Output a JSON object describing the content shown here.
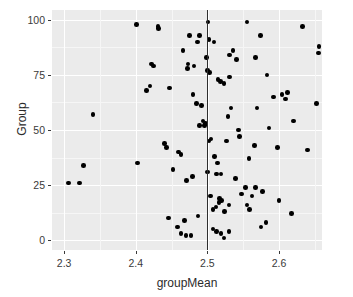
{
  "axes": {
    "x_title": "groupMean",
    "y_title": "Group",
    "x_ticks": [
      {
        "label": "2.3",
        "value": 2.3
      },
      {
        "label": "2.4",
        "value": 2.4
      },
      {
        "label": "2.5",
        "value": 2.5
      },
      {
        "label": "2.6",
        "value": 2.6
      }
    ],
    "y_ticks": [
      {
        "label": "0",
        "value": 0
      },
      {
        "label": "25",
        "value": 25
      },
      {
        "label": "50",
        "value": 50
      },
      {
        "label": "75",
        "value": 75
      },
      {
        "label": "100",
        "value": 100
      }
    ]
  },
  "style": {
    "panel_background": "#ebebeb",
    "gridline_major": "#ffffff",
    "gridline_minor": "#f6f6f6",
    "point_color": "#000000",
    "reference_line_color": "#2e2e2e",
    "text_color": "#3a3a3a"
  },
  "chart_data": {
    "type": "scatter",
    "title": "",
    "xlabel": "groupMean",
    "ylabel": "Group",
    "xlim": [
      2.283,
      2.66
    ],
    "ylim": [
      -4.5,
      104.5
    ],
    "grid": true,
    "legend": "none",
    "annotations": [
      {
        "type": "vline",
        "x": 2.5,
        "color": "#2e2e2e",
        "label": "overall mean"
      }
    ],
    "x": [
      2.401,
      2.431,
      2.432,
      2.475,
      2.489,
      2.555,
      2.633,
      2.486,
      2.501,
      2.422,
      2.425,
      2.502,
      2.509,
      2.466,
      2.472,
      2.531,
      2.536,
      2.656,
      2.655,
      2.574,
      2.499,
      2.473,
      2.541,
      2.481,
      2.447,
      2.5,
      2.503,
      2.515,
      2.518,
      2.523,
      2.531,
      2.567,
      2.583,
      2.415,
      2.42,
      2.48,
      2.485,
      2.492,
      2.592,
      2.604,
      2.612,
      2.609,
      2.652,
      2.34,
      2.494,
      2.497,
      2.489,
      2.496,
      2.529,
      2.533,
      2.543,
      2.569,
      2.62,
      2.502,
      2.505,
      2.527,
      2.545,
      2.558,
      2.586,
      2.64,
      2.321,
      2.44,
      2.443,
      2.566,
      2.598,
      2.327,
      2.402,
      2.452,
      2.46,
      2.463,
      2.479,
      2.51,
      2.514,
      2.519,
      2.539,
      2.567,
      2.577,
      2.306,
      2.471,
      2.5,
      2.513,
      2.517,
      2.52,
      2.53,
      2.548,
      2.553,
      2.562,
      2.6,
      2.504,
      2.508,
      2.512,
      2.516,
      2.524,
      2.555,
      2.559,
      2.582,
      2.617,
      2.446,
      2.468,
      2.487,
      2.575,
      2.458,
      2.463,
      2.47,
      2.477,
      2.508,
      2.513,
      2.519,
      2.523,
      2.53
    ],
    "y": [
      98,
      97,
      96,
      93,
      93,
      99,
      97,
      90,
      99,
      80,
      79,
      91,
      90,
      86,
      78,
      84,
      86,
      88,
      85,
      93,
      83,
      80,
      82,
      79,
      69,
      77,
      76,
      73,
      72,
      71,
      74,
      83,
      75,
      68,
      70,
      66,
      62,
      61,
      65,
      66,
      67,
      64,
      62,
      57,
      54,
      53,
      52,
      52,
      56,
      60,
      50,
      60,
      54,
      45,
      46,
      45,
      47,
      37,
      51,
      41,
      26,
      44,
      42,
      43,
      42,
      34,
      35,
      32,
      40,
      39,
      29,
      38,
      35,
      30,
      28,
      24,
      22,
      26,
      27,
      31,
      30,
      19,
      18,
      16,
      21,
      24,
      20,
      18,
      20,
      14,
      15,
      17,
      13,
      16,
      14,
      8,
      12,
      10,
      9,
      11,
      6,
      6,
      3,
      2,
      2,
      5,
      4,
      3,
      1,
      4
    ]
  }
}
